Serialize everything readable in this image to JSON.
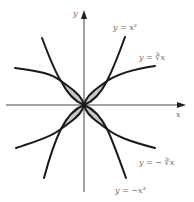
{
  "diagram": {
    "axes": {
      "x_label": "x",
      "y_label": "y"
    },
    "curves": [
      {
        "id": "x-cubed",
        "label": "y = x²"
      },
      {
        "id": "cube-root",
        "label": "y = ∛x"
      },
      {
        "id": "neg-cube-root",
        "label": "y = − ∛x"
      },
      {
        "id": "neg-x-cubed",
        "label": "y = −x³"
      }
    ],
    "colors": {
      "curve": "#1a1a1a",
      "shade": "#c8c8c8",
      "axis": "#444444",
      "label": "#6a6a6a"
    }
  }
}
